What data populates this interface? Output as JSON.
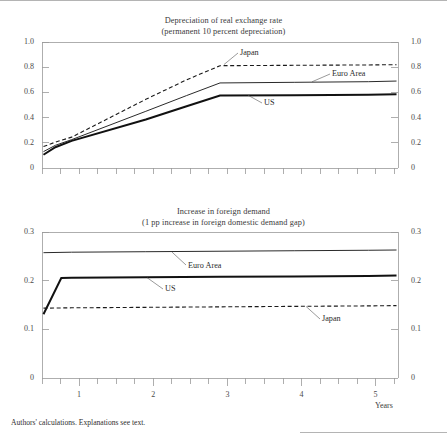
{
  "figure": {
    "footnote": "Authors' calculations. Explanations see text.",
    "x_axis_name": "Years"
  },
  "chart_data": [
    {
      "type": "line",
      "title": "Depreciation of real exchange rate",
      "subtitle": "(permanent 10  percent depreciation)",
      "xlabel": "Years",
      "ylabel": "",
      "xlim": [
        0.6,
        5.4
      ],
      "ylim": [
        0,
        1.0
      ],
      "yticks": [
        0,
        0.2,
        0.4,
        0.6,
        0.8,
        1.0
      ],
      "ytick_labels": [
        "0",
        "0.2",
        "0.4",
        "0.6",
        "0.8",
        "1.0"
      ],
      "xticks": [
        1,
        2,
        3,
        4,
        5
      ],
      "xtick_labels": [
        "1",
        "2",
        "3",
        "4",
        "5"
      ],
      "minor_xtick_step": 0.25,
      "grid": false,
      "dual_y_axis": true,
      "legend": "inline-annotations",
      "series": [
        {
          "name": "Japan",
          "style": "dashed",
          "width": 1.1,
          "color": "#1a1a1a",
          "x": [
            0.62,
            0.78,
            1.0,
            2.0,
            2.55,
            3.0,
            4.0,
            5.0,
            5.38
          ],
          "values": [
            0.17,
            0.205,
            0.245,
            0.545,
            0.7,
            0.812,
            0.815,
            0.818,
            0.82
          ]
        },
        {
          "name": "Euro Area",
          "style": "solid",
          "width": 1.0,
          "color": "#2a2a2a",
          "x": [
            0.62,
            0.78,
            1.0,
            2.0,
            2.55,
            3.0,
            4.0,
            5.0,
            5.38
          ],
          "values": [
            0.13,
            0.18,
            0.225,
            0.45,
            0.575,
            0.675,
            0.68,
            0.685,
            0.69
          ]
        },
        {
          "name": "US",
          "style": "solid",
          "width": 2.0,
          "color": "#111111",
          "x": [
            0.62,
            0.78,
            1.0,
            2.0,
            2.55,
            3.0,
            4.0,
            5.0,
            5.38
          ],
          "values": [
            0.105,
            0.165,
            0.215,
            0.385,
            0.49,
            0.575,
            0.578,
            0.582,
            0.586
          ]
        }
      ],
      "annotations": [
        {
          "text": "Japan",
          "series": "Japan"
        },
        {
          "text": "Euro Area",
          "series": "Euro Area"
        },
        {
          "text": "US",
          "series": "US"
        }
      ]
    },
    {
      "type": "line",
      "title": "Increase in foreign demand",
      "subtitle": "(1 pp increase in foreign domestic demand gap)",
      "xlabel": "Years",
      "ylabel": "",
      "xlim": [
        0.6,
        5.4
      ],
      "ylim": [
        0,
        0.3
      ],
      "yticks": [
        0,
        0.1,
        0.2,
        0.3
      ],
      "ytick_labels": [
        "0",
        "0.1",
        "0.2",
        "0.3"
      ],
      "xticks": [
        1,
        2,
        3,
        4,
        5
      ],
      "xtick_labels": [
        "1",
        "2",
        "3",
        "4",
        "5"
      ],
      "minor_xtick_step": 0.25,
      "grid": false,
      "dual_y_axis": true,
      "legend": "inline-annotations",
      "series": [
        {
          "name": "Euro Area",
          "style": "solid",
          "width": 1.0,
          "color": "#2a2a2a",
          "x": [
            0.62,
            1.0,
            2.0,
            3.0,
            4.0,
            5.0,
            5.38
          ],
          "values": [
            0.2575,
            0.2585,
            0.2595,
            0.2605,
            0.2615,
            0.2625,
            0.263
          ]
        },
        {
          "name": "US",
          "style": "solid",
          "width": 2.0,
          "color": "#111111",
          "x": [
            0.62,
            0.86,
            1.0,
            2.0,
            3.0,
            4.0,
            5.0,
            5.38
          ],
          "values": [
            0.131,
            0.2055,
            0.2058,
            0.2068,
            0.2078,
            0.2088,
            0.2098,
            0.2105
          ]
        },
        {
          "name": "Japan",
          "style": "dashed",
          "width": 1.1,
          "color": "#1a1a1a",
          "x": [
            0.62,
            1.0,
            2.0,
            3.0,
            4.0,
            5.0,
            5.38
          ],
          "values": [
            0.1435,
            0.1442,
            0.1452,
            0.1462,
            0.1472,
            0.1482,
            0.1488
          ]
        }
      ],
      "annotations": [
        {
          "text": "Euro Area",
          "series": "Euro Area"
        },
        {
          "text": "US",
          "series": "US"
        },
        {
          "text": "Japan",
          "series": "Japan"
        }
      ]
    }
  ],
  "top_chart": {
    "title_line1": "Depreciation of real exchange rate",
    "title_line2": "(permanent 10  percent depreciation)",
    "y_labels": {
      "t10": "1.0",
      "t08": "0.8",
      "t06": "0.6",
      "t04": "0.4",
      "t02": "0.2",
      "t00": "0"
    },
    "annotations": {
      "japan": "Japan",
      "euro_area": "Euro Area",
      "us": "US"
    }
  },
  "bottom_chart": {
    "title_line1": "Increase in foreign demand",
    "title_line2": "(1 pp increase in foreign domestic demand gap)",
    "y_labels": {
      "t03": "0.3",
      "t02": "0.2",
      "t01": "0.1",
      "t00": "0"
    },
    "x_labels": {
      "x1": "1",
      "x2": "2",
      "x3": "3",
      "x4": "4",
      "x5": "5"
    },
    "annotations": {
      "euro_area": "Euro Area",
      "us": "US",
      "japan": "Japan"
    }
  }
}
